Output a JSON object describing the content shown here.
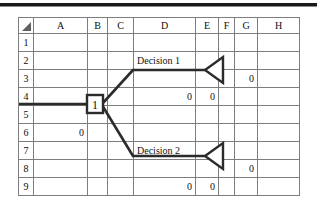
{
  "sheet": {
    "corner_icon": "select-all-triangle-icon",
    "columns": [
      "A",
      "B",
      "C",
      "D",
      "E",
      "F",
      "G",
      "H"
    ],
    "rows": [
      "1",
      "2",
      "3",
      "4",
      "5",
      "6",
      "7",
      "8",
      "9"
    ],
    "cells": {
      "D2": "Decision 1",
      "G3": "0",
      "D4": "0",
      "E4": "0",
      "B5": "1",
      "A6": "0",
      "D7": "Decision 2",
      "G8": "0",
      "D9": "0",
      "E9": "0"
    }
  },
  "tree": {
    "root_node_label": "1",
    "root_node_shape": "square-decision-node",
    "branches": [
      {
        "name": "upper-branch",
        "label": "Decision 1",
        "terminal_shape": "left-pointing-triangle-endpoint",
        "terminal_value": "0",
        "branch_values": [
          "0",
          "0"
        ]
      },
      {
        "name": "lower-branch",
        "label": "Decision 2",
        "terminal_shape": "left-pointing-triangle-endpoint",
        "terminal_value": "0",
        "branch_values": [
          "0",
          "0"
        ]
      }
    ],
    "inbound_value": "0"
  },
  "colors": {
    "header_fill": "#c9c9c9",
    "grid_line": "#7d7d7d",
    "sheet_border": "#4a4a4a",
    "tree_line": "#2b2b2b",
    "text": "#111111"
  }
}
